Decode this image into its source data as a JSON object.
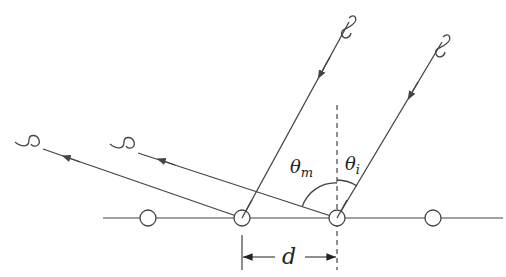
{
  "diagram": {
    "title": "",
    "labels": {
      "theta_m": "θ",
      "theta_m_sub": "m",
      "theta_i": "θ",
      "theta_i_sub": "i",
      "spacing": "d"
    },
    "atoms_x": [
      148,
      242,
      337,
      433
    ],
    "baseline_y": 218,
    "colors": {
      "line": "#444444",
      "text": "#222222",
      "background": "#ffffff"
    }
  }
}
